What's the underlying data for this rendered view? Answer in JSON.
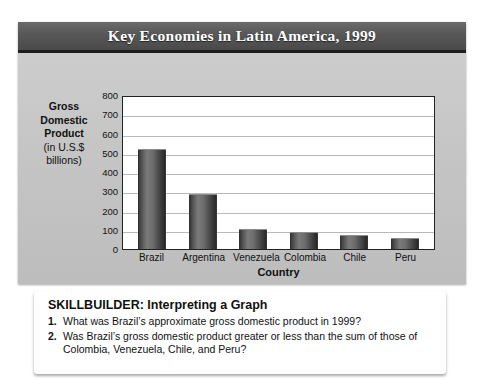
{
  "figure": {
    "title": "Key Economies in Latin America, 1999"
  },
  "chart_data": {
    "type": "bar",
    "title": "Key Economies in Latin America, 1999",
    "xlabel": "Country",
    "ylabel": "Gross Domestic Product (in U.S.$ billions)",
    "ylabel_lines": {
      "line1": "Gross",
      "line2": "Domestic",
      "line3": "Product",
      "line4": "(in U.S.$",
      "line5": "billions)"
    },
    "categories": [
      "Brazil",
      "Argentina",
      "Venezuela",
      "Colombia",
      "Chile",
      "Peru"
    ],
    "values": [
      520,
      285,
      103,
      88,
      73,
      58
    ],
    "ylim": [
      0,
      800
    ],
    "yticks": [
      800,
      700,
      600,
      500,
      400,
      300,
      200,
      100,
      0
    ],
    "ytick_labels": [
      "800",
      "700",
      "600",
      "500",
      "400",
      "300",
      "200",
      "100",
      "0"
    ],
    "grid": true,
    "legend": false,
    "bar_color": "#5a5a5a",
    "plot_background": "#ffffff",
    "panel_background": "#c9c9c9",
    "title_bar_color": "#575757",
    "title_text_color": "#ffffff"
  },
  "skillbuilder": {
    "heading": "SKILLBUILDER: Interpreting a Graph",
    "questions": [
      {
        "number": "1.",
        "text": "What was Brazil’s approximate gross domestic product in 1999?"
      },
      {
        "number": "2.",
        "text": "Was Brazil’s gross domestic product greater or less than the sum of those of Colombia, Venezuela, Chile, and Peru?"
      }
    ]
  }
}
